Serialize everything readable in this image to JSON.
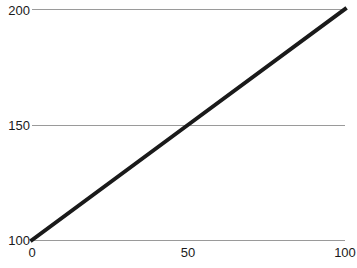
{
  "chart_data": {
    "type": "line",
    "title": "",
    "xlabel": "",
    "ylabel": "",
    "xlim": [
      0,
      100
    ],
    "ylim": [
      100,
      200
    ],
    "xticks": [
      "0",
      "50",
      "100"
    ],
    "xtick_values": [
      0,
      50,
      100
    ],
    "yticks": [
      "200",
      "150",
      "100"
    ],
    "ytick_values": [
      200,
      150,
      100
    ],
    "grid": "horizontal",
    "legend": "none",
    "series": [
      {
        "name": "",
        "color": "#1a1a1a",
        "linewidth": 4,
        "x": [
          0,
          50,
          100
        ],
        "values": [
          100,
          150,
          200
        ]
      }
    ]
  },
  "axes": {
    "y_tick_0": "200",
    "y_tick_1": "150",
    "y_tick_2": "100",
    "x_tick_0": "0",
    "x_tick_1": "50",
    "x_tick_2": "100"
  },
  "colors": {
    "line": "#1a1a1a",
    "grid": "#9a9a9a",
    "text": "#1a1a1a",
    "background": "#ffffff"
  }
}
